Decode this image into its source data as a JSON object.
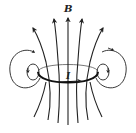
{
  "diagram": {
    "labels": {
      "field": "B",
      "current": "I"
    },
    "colors": {
      "line": "#222222",
      "loop": "#111111",
      "loop_back": "#555555",
      "background": "#ffffff"
    },
    "elements": {
      "loop": "elliptical current loop with arrow indicating current direction (left to right on front edge)",
      "field_lines_up": 5,
      "side_loops": 2,
      "inner_side_loops": 2
    }
  }
}
